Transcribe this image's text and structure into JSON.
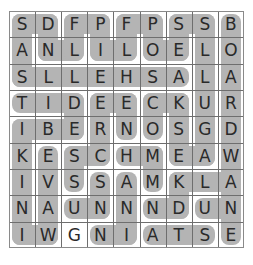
{
  "puzzle": {
    "type": "word-search",
    "rows": 9,
    "cols": 9,
    "grid": [
      [
        "S",
        "D",
        "F",
        "P",
        "F",
        "P",
        "S",
        "S",
        "B"
      ],
      [
        "A",
        "N",
        "L",
        "I",
        "L",
        "O",
        "E",
        "L",
        "O"
      ],
      [
        "S",
        "L",
        "L",
        "E",
        "H",
        "S",
        "A",
        "L",
        "A"
      ],
      [
        "T",
        "I",
        "D",
        "E",
        "E",
        "C",
        "K",
        "U",
        "R"
      ],
      [
        "I",
        "B",
        "E",
        "R",
        "N",
        "O",
        "S",
        "G",
        "D"
      ],
      [
        "K",
        "E",
        "S",
        "C",
        "H",
        "M",
        "E",
        "A",
        "W"
      ],
      [
        "I",
        "V",
        "S",
        "S",
        "A",
        "M",
        "K",
        "L",
        "A"
      ],
      [
        "N",
        "A",
        "U",
        "N",
        "N",
        "N",
        "D",
        "U",
        "N"
      ],
      [
        "I",
        "W",
        "G",
        "N",
        "I",
        "A",
        "T",
        "S",
        "E"
      ]
    ],
    "highlight_color": "#b4b4b4",
    "grid_line_color": "#6e6e6e",
    "letter_color": "#2a2a2a"
  }
}
